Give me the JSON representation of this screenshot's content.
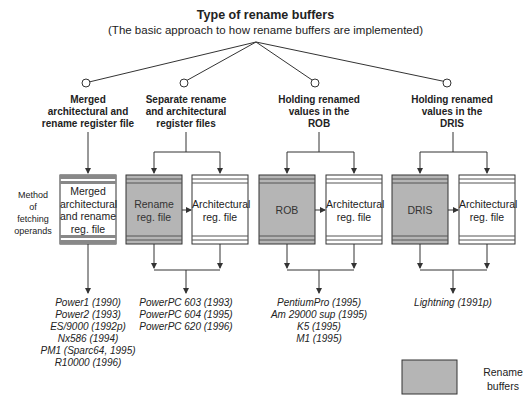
{
  "title": "Type of rename buffers",
  "subtitle": "(The basic approach to how rename buffers are implemented)",
  "row_label": "Method\nof\nfetching\noperands",
  "categories": [
    {
      "label": "Merged\narchitectural and\nrename register file",
      "boxes": [
        {
          "label": "Merged\narchitectural\nand rename\nreg. file",
          "shaded": false
        }
      ],
      "examples": [
        "Power1 (1990)",
        "Power2 (1993)",
        "ES/9000 (1992p)",
        "Nx586 (1994)",
        "PM1 (Sparc64, 1995)",
        "R10000 (1996)"
      ]
    },
    {
      "label": "Separate rename\nand architectural\nregister files",
      "boxes": [
        {
          "label": "Rename\nreg. file",
          "shaded": true
        },
        {
          "label": "Architectural\nreg. file",
          "shaded": false
        }
      ],
      "examples": [
        "PowerPC 603 (1993)",
        "PowerPC 604 (1995)",
        "PowerPC 620 (1996)"
      ]
    },
    {
      "label": "Holding renamed\nvalues in the\nROB",
      "boxes": [
        {
          "label": "ROB",
          "shaded": true
        },
        {
          "label": "Architectural\nreg. file",
          "shaded": false
        }
      ],
      "examples": [
        "PentiumPro (1995)",
        "Am 29000 sup (1995)",
        "K5 (1995)",
        "M1 (1995)"
      ]
    },
    {
      "label": "Holding renamed\nvalues in the\nDRIS",
      "boxes": [
        {
          "label": "DRIS",
          "shaded": true
        },
        {
          "label": "Architectural\nreg. file",
          "shaded": false
        }
      ],
      "examples": [
        "Lightning (1991p)"
      ]
    }
  ],
  "legend": {
    "label": "Rename\nbuffers",
    "color": "#b5b5b5"
  },
  "colors": {
    "shade": "#b5b5b5",
    "stripe": "#888888",
    "line": "#333333"
  }
}
